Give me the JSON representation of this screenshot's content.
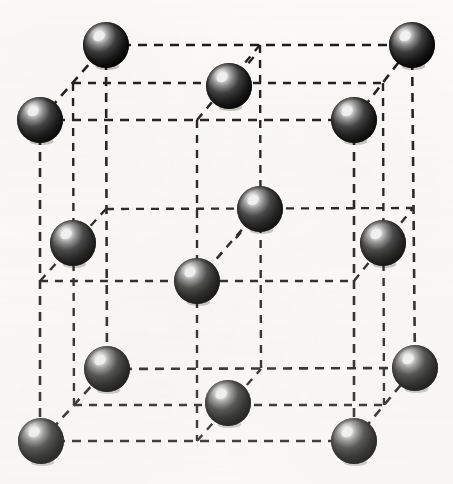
{
  "figure": {
    "canvas": {
      "width": 453,
      "height": 484
    },
    "background_color": "#fbfaf8",
    "atom_count": 14,
    "corner_atom_count": 8,
    "face_center_atom_count": 6
  },
  "style": {
    "line_color": "#1b1b1b",
    "line_width": 2.6,
    "dash_pattern": "9 7",
    "atom_fill_dark": "#111111",
    "atom_fill_mid": "#2f2f2f",
    "atom_highlight": "#f2f2f2",
    "atom_rim": "#000000",
    "atom_radius": 22
  },
  "geometry": {
    "front_face": {
      "top_left": {
        "x": 40,
        "y": 120
      },
      "top_right": {
        "x": 354,
        "y": 120
      },
      "bottom_right": {
        "x": 354,
        "y": 441
      },
      "bottom_left": {
        "x": 40,
        "y": 441
      }
    },
    "back_face": {
      "top_left": {
        "x": 106,
        "y": 45
      },
      "top_right": {
        "x": 412,
        "y": 45
      },
      "bottom_right": {
        "x": 415,
        "y": 368
      },
      "bottom_left": {
        "x": 107,
        "y": 369
      }
    },
    "mid_front": {
      "top": {
        "x": 197,
        "y": 120
      },
      "bottom": {
        "x": 197,
        "y": 441
      },
      "left": {
        "x": 40,
        "y": 281
      },
      "right": {
        "x": 354,
        "y": 281
      }
    },
    "mid_back": {
      "top": {
        "x": 260,
        "y": 45
      },
      "bottom": {
        "x": 261,
        "y": 369
      },
      "left": {
        "x": 106,
        "y": 209
      },
      "right": {
        "x": 413,
        "y": 208
      }
    }
  },
  "atoms": [
    {
      "id": "corner-front-top-left",
      "label": "Corner atom, front top left",
      "x": 40,
      "y": 120,
      "r": 23,
      "site": "corner"
    },
    {
      "id": "corner-front-top-right",
      "label": "Corner atom, front top right",
      "x": 354,
      "y": 120,
      "r": 23,
      "site": "corner"
    },
    {
      "id": "corner-front-bottom-left",
      "label": "Corner atom, front bottom left",
      "x": 41,
      "y": 441,
      "r": 23,
      "site": "corner"
    },
    {
      "id": "corner-front-bottom-right",
      "label": "Corner atom, front bottom right",
      "x": 354,
      "y": 441,
      "r": 23,
      "site": "corner"
    },
    {
      "id": "corner-back-top-left",
      "label": "Corner atom, back top left",
      "x": 106,
      "y": 45,
      "r": 23,
      "site": "corner"
    },
    {
      "id": "corner-back-top-right",
      "label": "Corner atom, back top right",
      "x": 412,
      "y": 45,
      "r": 23,
      "site": "corner"
    },
    {
      "id": "corner-back-bottom-left",
      "label": "Corner atom, back bottom left",
      "x": 107,
      "y": 369,
      "r": 23,
      "site": "corner"
    },
    {
      "id": "corner-back-bottom-right",
      "label": "Corner atom, back bottom right",
      "x": 415,
      "y": 368,
      "r": 23,
      "site": "corner"
    },
    {
      "id": "face-center-top",
      "label": "Face-center atom, top face",
      "x": 229,
      "y": 86,
      "r": 23,
      "site": "face-center"
    },
    {
      "id": "face-center-bottom",
      "label": "Face-center atom, bottom face",
      "x": 228,
      "y": 403,
      "r": 23,
      "site": "face-center"
    },
    {
      "id": "face-center-left",
      "label": "Face-center atom, left face",
      "x": 73,
      "y": 243,
      "r": 23,
      "site": "face-center"
    },
    {
      "id": "face-center-right",
      "label": "Face-center atom, right face",
      "x": 383,
      "y": 243,
      "r": 23,
      "site": "face-center"
    },
    {
      "id": "face-center-front",
      "label": "Face-center atom, front face",
      "x": 197,
      "y": 281,
      "r": 23,
      "site": "face-center"
    },
    {
      "id": "face-center-back",
      "label": "Face-center atom, back face",
      "x": 260,
      "y": 209,
      "r": 23,
      "site": "face-center"
    }
  ],
  "edges": [
    {
      "id": "front-top",
      "label": "Front face top edge",
      "x1": 40,
      "y1": 120,
      "x2": 354,
      "y2": 120
    },
    {
      "id": "front-bottom",
      "label": "Front face bottom edge",
      "x1": 40,
      "y1": 441,
      "x2": 354,
      "y2": 441
    },
    {
      "id": "front-left",
      "label": "Front face left edge",
      "x1": 40,
      "y1": 120,
      "x2": 40,
      "y2": 441
    },
    {
      "id": "front-right",
      "label": "Front face right edge",
      "x1": 354,
      "y1": 120,
      "x2": 354,
      "y2": 441
    },
    {
      "id": "back-top",
      "label": "Back face top edge",
      "x1": 106,
      "y1": 45,
      "x2": 412,
      "y2": 45
    },
    {
      "id": "back-bottom",
      "label": "Back face bottom edge",
      "x1": 107,
      "y1": 369,
      "x2": 415,
      "y2": 368
    },
    {
      "id": "back-left",
      "label": "Back face left edge",
      "x1": 106,
      "y1": 45,
      "x2": 107,
      "y2": 369
    },
    {
      "id": "back-right",
      "label": "Back face right edge",
      "x1": 412,
      "y1": 45,
      "x2": 415,
      "y2": 368
    },
    {
      "id": "depth-top-left",
      "label": "Depth edge, top left",
      "x1": 40,
      "y1": 120,
      "x2": 106,
      "y2": 45
    },
    {
      "id": "depth-top-right",
      "label": "Depth edge, top right",
      "x1": 354,
      "y1": 120,
      "x2": 412,
      "y2": 45
    },
    {
      "id": "depth-bottom-left",
      "label": "Depth edge, bottom left",
      "x1": 41,
      "y1": 441,
      "x2": 107,
      "y2": 369
    },
    {
      "id": "depth-bottom-right",
      "label": "Depth edge, bottom right",
      "x1": 354,
      "y1": 441,
      "x2": 415,
      "y2": 368
    }
  ],
  "grid_lines": [
    {
      "id": "front-mid-horizontal",
      "label": "Front face mid horizontal guide",
      "x1": 40,
      "y1": 281,
      "x2": 354,
      "y2": 281
    },
    {
      "id": "front-mid-vertical",
      "label": "Front face mid vertical guide",
      "x1": 197,
      "y1": 120,
      "x2": 197,
      "y2": 441
    },
    {
      "id": "back-mid-horizontal",
      "label": "Back face mid horizontal guide",
      "x1": 106,
      "y1": 209,
      "x2": 413,
      "y2": 208
    },
    {
      "id": "back-mid-vertical",
      "label": "Back face mid vertical guide",
      "x1": 260,
      "y1": 45,
      "x2": 261,
      "y2": 369
    },
    {
      "id": "top-mid-depth-left",
      "label": "Top face depth guide, left",
      "x1": 197,
      "y1": 120,
      "x2": 260,
      "y2": 45
    },
    {
      "id": "bottom-mid-depth",
      "label": "Bottom face depth guide",
      "x1": 197,
      "y1": 441,
      "x2": 261,
      "y2": 369
    },
    {
      "id": "left-mid-depth",
      "label": "Left face depth guide",
      "x1": 40,
      "y1": 281,
      "x2": 106,
      "y2": 209
    },
    {
      "id": "right-mid-depth",
      "label": "Right face depth guide",
      "x1": 354,
      "y1": 281,
      "x2": 413,
      "y2": 208
    },
    {
      "id": "top-mid-horizontal",
      "label": "Top face mid horizontal guide",
      "x1": 73,
      "y1": 83,
      "x2": 383,
      "y2": 83
    },
    {
      "id": "bottom-mid-horizontal",
      "label": "Bottom face mid horizontal guide",
      "x1": 74,
      "y1": 405,
      "x2": 384,
      "y2": 405
    },
    {
      "id": "left-mid-vertical",
      "label": "Left face mid vertical guide",
      "x1": 73,
      "y1": 83,
      "x2": 74,
      "y2": 405
    },
    {
      "id": "right-mid-vertical",
      "label": "Right face mid vertical guide",
      "x1": 383,
      "y1": 83,
      "x2": 384,
      "y2": 405
    },
    {
      "id": "center-depth-diagonal",
      "label": "Body diagonal guide through centers",
      "x1": 197,
      "y1": 281,
      "x2": 260,
      "y2": 209
    }
  ],
  "bond_stubs": [
    {
      "id": "stub-top-face-center-upleft",
      "label": "Bond stub from top face atom",
      "x1": 229,
      "y1": 86,
      "x2": 258,
      "y2": 52
    },
    {
      "id": "stub-back-center-downleft",
      "label": "Bond stub from back center atom",
      "x1": 260,
      "y1": 209,
      "x2": 232,
      "y2": 243
    },
    {
      "id": "stub-front-center-upright",
      "label": "Bond stub from front center atom",
      "x1": 197,
      "y1": 281,
      "x2": 227,
      "y2": 247
    }
  ]
}
